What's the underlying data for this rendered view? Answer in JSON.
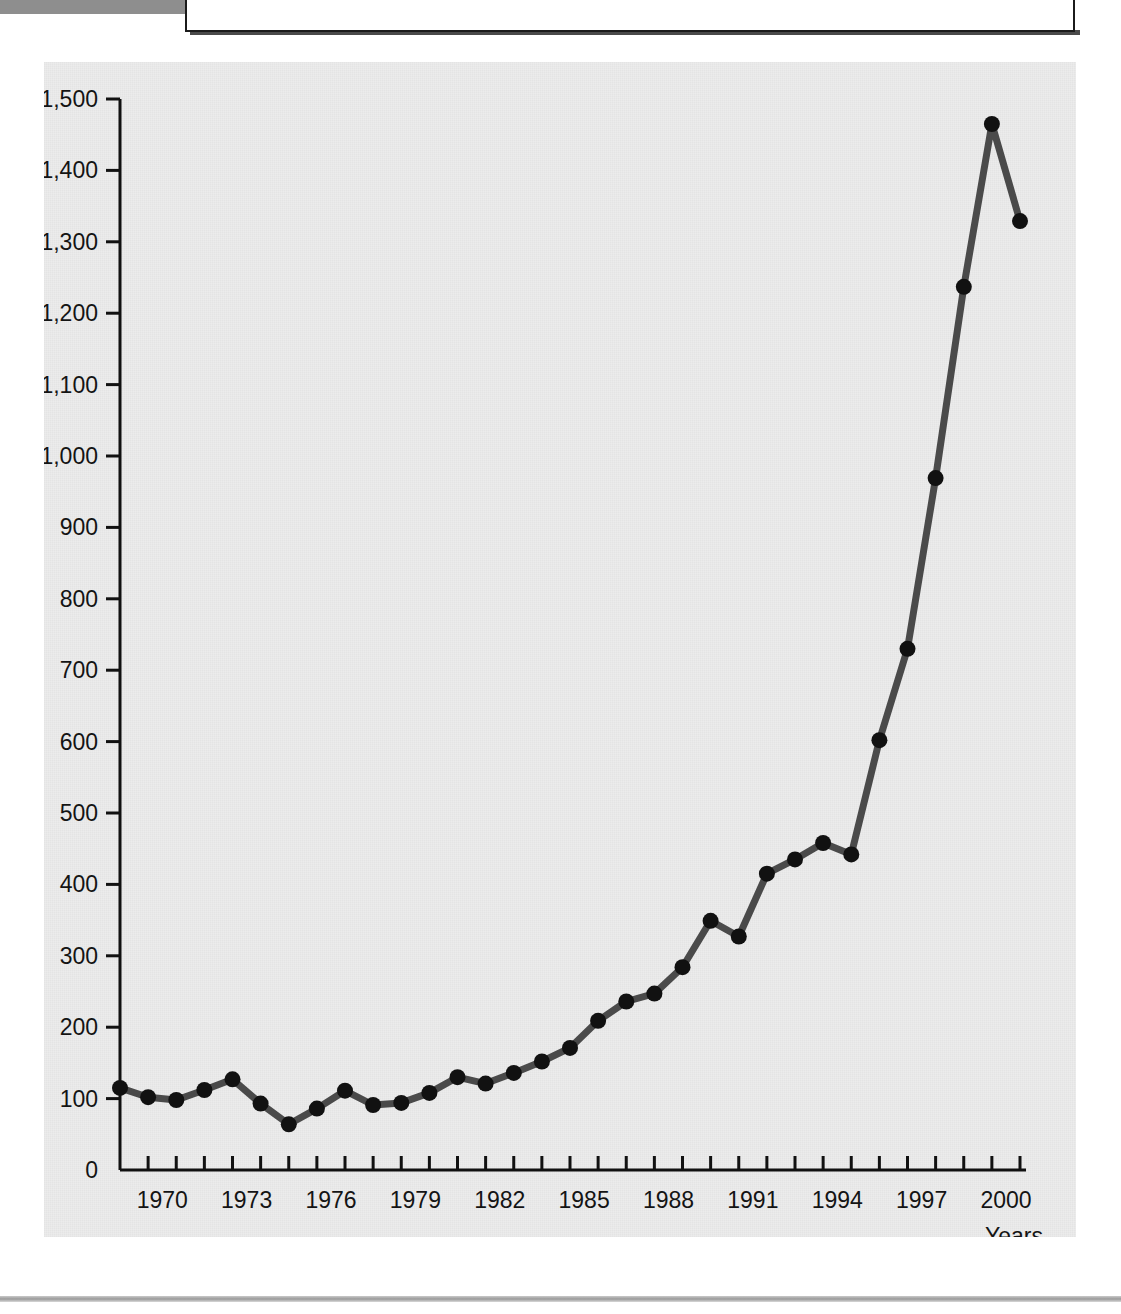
{
  "header": {
    "figure_tab_label": "FIGURE 1.6",
    "caption": "Car accidents, 1968-2000"
  },
  "chart_data": {
    "type": "line",
    "title": "",
    "xlabel": "Years",
    "ylabel": "",
    "xlim": [
      1968,
      2000
    ],
    "ylim": [
      0,
      1500
    ],
    "y_ticks": [
      0,
      100,
      200,
      300,
      400,
      500,
      600,
      700,
      800,
      900,
      1000,
      1100,
      1200,
      1300,
      1400,
      1500
    ],
    "y_tick_labels": [
      "0",
      "100",
      "200",
      "300",
      "400",
      "500",
      "600",
      "700",
      "800",
      "900",
      "1,000",
      "1,100",
      "1,200",
      "1,300",
      "1,400",
      "1,500"
    ],
    "x_ticks": [
      1969,
      1970,
      1971,
      1972,
      1973,
      1974,
      1975,
      1976,
      1977,
      1978,
      1979,
      1980,
      1981,
      1982,
      1983,
      1984,
      1985,
      1986,
      1987,
      1988,
      1989,
      1990,
      1991,
      1992,
      1993,
      1994,
      1995,
      1996,
      1997,
      1998,
      1999,
      2000
    ],
    "x_tick_labels": [
      "1970",
      "1973",
      "1976",
      "1979",
      "1982",
      "1985",
      "1988",
      "1991",
      "1994",
      "1997",
      "2000"
    ],
    "x_labeled_years": [
      1970,
      1973,
      1976,
      1979,
      1982,
      1985,
      1988,
      1991,
      1994,
      1997,
      2000
    ],
    "grid": false,
    "legend": null,
    "marker": "circle",
    "line_color": "#4a4a4a",
    "marker_color": "#111111",
    "background_color": "#ececec",
    "x": [
      1968,
      1969,
      1970,
      1971,
      1972,
      1973,
      1974,
      1975,
      1976,
      1977,
      1978,
      1979,
      1980,
      1981,
      1982,
      1983,
      1984,
      1985,
      1986,
      1987,
      1988,
      1989,
      1990,
      1991,
      1992,
      1993,
      1994,
      1995,
      1996,
      1997,
      1998,
      1999,
      2000
    ],
    "values": [
      115,
      102,
      98,
      112,
      127,
      93,
      64,
      86,
      111,
      91,
      94,
      108,
      130,
      121,
      136,
      152,
      171,
      209,
      236,
      247,
      284,
      349,
      327,
      415,
      435,
      458,
      442,
      602,
      730,
      969,
      1237,
      1465,
      1329
    ],
    "series": [
      {
        "name": "Car accidents",
        "values": [
          115,
          102,
          98,
          112,
          127,
          93,
          64,
          86,
          111,
          91,
          94,
          108,
          130,
          121,
          136,
          152,
          171,
          209,
          236,
          247,
          284,
          349,
          327,
          415,
          435,
          458,
          442,
          602,
          730,
          969,
          1237,
          1465,
          1329
        ]
      }
    ]
  }
}
